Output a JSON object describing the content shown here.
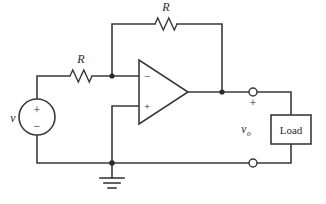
{
  "figure": {
    "background_color": "#ffffff",
    "line_color": "#3a3a3a",
    "width": 326,
    "height": 204
  },
  "labels": {
    "source_label": "v",
    "input_resistor_label": "R",
    "feedback_resistor_label": "R",
    "output_voltage_label": "v",
    "output_voltage_subscript": "o",
    "load_label": "Load",
    "source_plus": "+",
    "source_minus": "−",
    "opamp_inverting": "−",
    "opamp_noninverting": "+",
    "terminal_plus": "+"
  },
  "components": [
    {
      "id": "source",
      "type": "voltage-source",
      "name": "independent-voltage-source",
      "label": "v",
      "cx": 37,
      "cy": 117,
      "r": 18
    },
    {
      "id": "r-input",
      "type": "resistor",
      "name": "input-resistor",
      "label": "R",
      "orientation": "horizontal",
      "x1": 70,
      "x2": 92,
      "y": 76
    },
    {
      "id": "r-feedback",
      "type": "resistor",
      "name": "feedback-resistor",
      "label": "R",
      "orientation": "horizontal",
      "x1": 155,
      "x2": 177,
      "y": 24
    },
    {
      "id": "opamp",
      "type": "opamp",
      "name": "operational-amplifier",
      "left": 139,
      "right": 188,
      "top": 60,
      "bottom": 124,
      "inverting_y": 76,
      "noninverting_y": 106
    },
    {
      "id": "load",
      "type": "box",
      "name": "load-box",
      "label": "Load",
      "x": 271,
      "y": 115,
      "width": 40,
      "height": 29
    },
    {
      "id": "ground",
      "type": "ground",
      "name": "ground-symbol",
      "x": 112,
      "y": 163
    }
  ],
  "nodes": [
    {
      "name": "inverting-input-node",
      "x": 112,
      "y": 76
    },
    {
      "name": "output-node",
      "x": 222,
      "y": 92
    },
    {
      "name": "ground-node",
      "x": 112,
      "y": 163
    }
  ],
  "terminals": [
    {
      "name": "output-terminal-positive",
      "x": 253,
      "y": 92,
      "r": 4
    },
    {
      "name": "output-terminal-negative",
      "x": 253,
      "y": 163,
      "r": 4
    }
  ]
}
